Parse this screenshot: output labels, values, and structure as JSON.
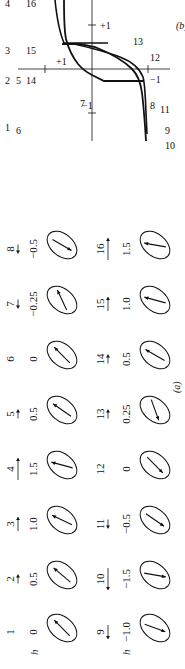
{
  "figure": {
    "panel_a_label": "(a)",
    "panel_b_label": "(b)",
    "row_label": "h",
    "rows": [
      {
        "states": [
          {
            "n": "1",
            "h": "0",
            "field_arrow": "none",
            "moment_angle": -45
          },
          {
            "n": "2",
            "h": "0.5",
            "field_arrow": "right-short",
            "moment_angle": -50
          },
          {
            "n": "3",
            "h": "1.0",
            "field_arrow": "right",
            "moment_angle": -65
          },
          {
            "n": "4",
            "h": "1.5",
            "field_arrow": "right-long",
            "moment_angle": -75
          },
          {
            "n": "5",
            "h": "0.5",
            "field_arrow": "right-short",
            "moment_angle": -55
          },
          {
            "n": "6",
            "h": "0",
            "field_arrow": "none",
            "moment_angle": -45
          },
          {
            "n": "7",
            "h": "−0.25",
            "field_arrow": "left-short",
            "moment_angle": -25
          },
          {
            "n": "8",
            "h": "−0.5",
            "field_arrow": "left-short",
            "moment_angle": 120
          }
        ]
      },
      {
        "states": [
          {
            "n": "9",
            "h": "−1.0",
            "field_arrow": "left",
            "moment_angle": 110
          },
          {
            "n": "10",
            "h": "−1.5",
            "field_arrow": "left-long",
            "moment_angle": 100
          },
          {
            "n": "11",
            "h": "−0.5",
            "field_arrow": "left-short",
            "moment_angle": 125
          },
          {
            "n": "12",
            "h": "0",
            "field_arrow": "none",
            "moment_angle": 135
          },
          {
            "n": "13",
            "h": "0.25",
            "field_arrow": "right-short",
            "moment_angle": 160
          },
          {
            "n": "14",
            "h": "0.5",
            "field_arrow": "right-short",
            "moment_angle": -60
          },
          {
            "n": "15",
            "h": "1.0",
            "field_arrow": "right",
            "moment_angle": -75
          },
          {
            "n": "16",
            "h": "1.5",
            "field_arrow": "right-long",
            "moment_angle": -80
          }
        ]
      }
    ],
    "hysteresis": {
      "x_axis_ticks": [
        "−1",
        "+1"
      ],
      "y_axis_ticks": [
        "+1",
        "−1"
      ],
      "point_labels_top": [
        "1",
        "2",
        "3",
        "4"
      ],
      "point_labels": [
        "5",
        "6",
        "7",
        "8",
        "9",
        "10",
        "11",
        "12",
        "13",
        "14",
        "15",
        "16"
      ]
    }
  }
}
